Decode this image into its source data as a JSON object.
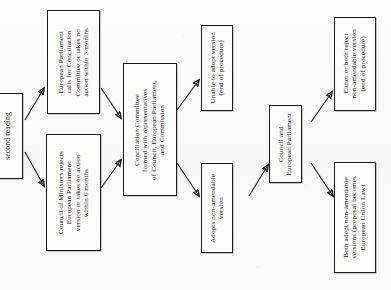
{
  "diagram": {
    "orientation": "text rotated 90 degrees counter-clockwise (scanned page)",
    "ink_color": "#1a1a1a",
    "paper_color": "#fbfbfa",
    "nodes": [
      {
        "id": "second-reading",
        "label": "second reading",
        "role": "entry-stage"
      },
      {
        "id": "ep-calls-conciliation",
        "label": "European Parliament\ncalls for Conciliation\nCommittee or takes no\naction within 3 months",
        "role": "process"
      },
      {
        "id": "council-rejects",
        "label": "Council of Ministers rejects\nEuropean Parliament\nversion or takes no action\nwithin 6 months",
        "role": "process"
      },
      {
        "id": "conciliation-committee",
        "label": "Conciliation Committee\nformed with representatives\nof Council, European Parliament,\nand Commission",
        "role": "process"
      },
      {
        "id": "unable-to-adopt",
        "label": "Unable to adopt version\n(end of procedure)",
        "role": "terminal"
      },
      {
        "id": "adopts-non-amendable",
        "label": "Adopts non-amendable\nversion",
        "role": "process"
      },
      {
        "id": "council-and-ep",
        "label": "Council and\nEuropean Parliament",
        "role": "process"
      },
      {
        "id": "either-or-both-reject",
        "label": "Either or both reject\nnon-amendable version\n(end of procedure)",
        "role": "terminal"
      },
      {
        "id": "both-adopt",
        "label": "Both adopt non-amendable\nversions (proposal becomes\nEuropean Union Law)",
        "role": "terminal"
      }
    ],
    "edges": [
      {
        "from": "second-reading",
        "to": "ep-calls-conciliation"
      },
      {
        "from": "second-reading",
        "to": "council-rejects"
      },
      {
        "from": "ep-calls-conciliation",
        "to": "conciliation-committee"
      },
      {
        "from": "council-rejects",
        "to": "conciliation-committee"
      },
      {
        "from": "conciliation-committee",
        "to": "unable-to-adopt"
      },
      {
        "from": "conciliation-committee",
        "to": "adopts-non-amendable"
      },
      {
        "from": "adopts-non-amendable",
        "to": "council-and-ep"
      },
      {
        "from": "council-and-ep",
        "to": "either-or-both-reject"
      },
      {
        "from": "council-and-ep",
        "to": "both-adopt"
      }
    ]
  }
}
